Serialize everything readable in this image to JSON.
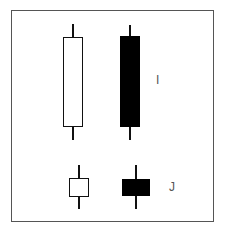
{
  "diagram": {
    "type": "candlestick-patterns",
    "colors": {
      "frame": "#555555",
      "bullish_body": "#ffffff",
      "bearish_body": "#000000",
      "wick": "#111111",
      "label": "#555555"
    },
    "groups": [
      {
        "label": "I",
        "description": "Long-body candles",
        "candles": [
          {
            "color": "white",
            "wick_top": 24,
            "body_top": 37,
            "body_bottom": 126,
            "wick_bottom": 140
          },
          {
            "color": "black",
            "wick_top": 25,
            "body_top": 36,
            "body_bottom": 127,
            "wick_bottom": 140
          }
        ]
      },
      {
        "label": "J",
        "description": "Short-body candles",
        "candles": [
          {
            "color": "white",
            "wick_top": 165,
            "body_top": 178,
            "body_bottom": 196,
            "wick_bottom": 209
          },
          {
            "color": "black",
            "wick_top": 165,
            "body_top": 179,
            "body_bottom": 196,
            "wick_bottom": 209
          }
        ]
      }
    ]
  }
}
